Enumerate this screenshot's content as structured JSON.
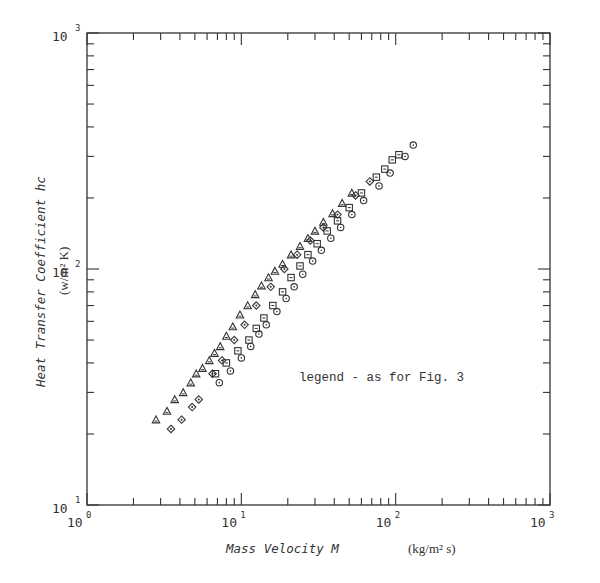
{
  "chart_data": {
    "type": "scatter",
    "title": "",
    "xlabel": "Mass Velocity M",
    "xunit": "(kg/m² s)",
    "ylabel": "Heat Transfer Coefficient hc",
    "yunit": "(w/m² K)",
    "xscale": "log",
    "yscale": "log",
    "xlim": [
      1,
      1000
    ],
    "ylim": [
      10,
      1000
    ],
    "x_tick_labels": [
      {
        "base": "10",
        "exp": "0"
      },
      {
        "base": "10",
        "exp": "1"
      },
      {
        "base": "10",
        "exp": "2"
      },
      {
        "base": "10",
        "exp": "3"
      }
    ],
    "y_tick_labels": [
      {
        "base": "10",
        "exp": "1"
      },
      {
        "base": "10",
        "exp": "2"
      },
      {
        "base": "10",
        "exp": "3"
      }
    ],
    "grid": false,
    "annotation": "legend - as for Fig. 3",
    "series": [
      {
        "name": "triangle",
        "marker": "triangle",
        "points": [
          [
            2.8,
            23
          ],
          [
            3.3,
            25
          ],
          [
            3.7,
            28
          ],
          [
            4.2,
            30
          ],
          [
            4.7,
            33
          ],
          [
            5.1,
            36
          ],
          [
            5.6,
            38
          ],
          [
            6.2,
            41
          ],
          [
            6.7,
            44
          ],
          [
            7.3,
            47
          ],
          [
            8.0,
            52
          ],
          [
            8.8,
            57
          ],
          [
            9.8,
            64
          ],
          [
            11.0,
            70
          ],
          [
            12.3,
            78
          ],
          [
            13.5,
            85
          ],
          [
            15.0,
            92
          ],
          [
            16.5,
            98
          ],
          [
            18.5,
            105
          ],
          [
            21,
            115
          ],
          [
            24,
            125
          ],
          [
            27,
            135
          ],
          [
            30,
            145
          ],
          [
            34,
            158
          ],
          [
            39,
            172
          ],
          [
            45,
            190
          ],
          [
            52,
            210
          ]
        ]
      },
      {
        "name": "diamond",
        "marker": "diamond",
        "points": [
          [
            3.5,
            21
          ],
          [
            4.1,
            23
          ],
          [
            4.8,
            26
          ],
          [
            5.3,
            28
          ],
          [
            6.5,
            36
          ],
          [
            7.5,
            41
          ],
          [
            9.0,
            50
          ],
          [
            10.5,
            58
          ],
          [
            12.5,
            70
          ],
          [
            15.5,
            84
          ],
          [
            19,
            100
          ],
          [
            23,
            115
          ],
          [
            28,
            132
          ],
          [
            34,
            150
          ],
          [
            42,
            170
          ],
          [
            55,
            205
          ],
          [
            68,
            235
          ]
        ]
      },
      {
        "name": "square",
        "marker": "square",
        "points": [
          [
            6.8,
            36
          ],
          [
            8.0,
            40
          ],
          [
            9.5,
            45
          ],
          [
            11.2,
            50
          ],
          [
            12.5,
            56
          ],
          [
            14.0,
            62
          ],
          [
            16.0,
            70
          ],
          [
            18.5,
            80
          ],
          [
            21,
            92
          ],
          [
            24,
            103
          ],
          [
            27,
            115
          ],
          [
            31,
            128
          ],
          [
            36,
            145
          ],
          [
            42,
            160
          ],
          [
            50,
            182
          ],
          [
            60,
            210
          ],
          [
            75,
            245
          ],
          [
            85,
            265
          ],
          [
            95,
            290
          ],
          [
            105,
            305
          ]
        ]
      },
      {
        "name": "circle",
        "marker": "circle",
        "points": [
          [
            7.2,
            33
          ],
          [
            8.5,
            37
          ],
          [
            10.0,
            42
          ],
          [
            11.5,
            47
          ],
          [
            13.0,
            53
          ],
          [
            14.5,
            58
          ],
          [
            17.0,
            66
          ],
          [
            19.5,
            75
          ],
          [
            22,
            84
          ],
          [
            25,
            95
          ],
          [
            29,
            108
          ],
          [
            33,
            120
          ],
          [
            38,
            135
          ],
          [
            44,
            150
          ],
          [
            52,
            170
          ],
          [
            62,
            195
          ],
          [
            78,
            225
          ],
          [
            92,
            255
          ],
          [
            115,
            300
          ],
          [
            130,
            335
          ]
        ]
      }
    ]
  }
}
